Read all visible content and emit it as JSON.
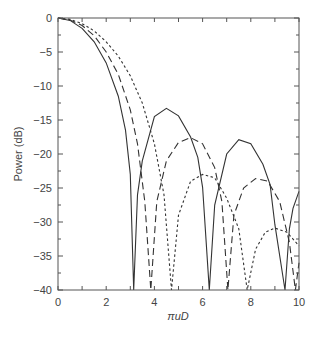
{
  "chart_data": {
    "type": "line",
    "title": "",
    "xlabel": "πuD",
    "ylabel": "Power (dB)",
    "xlim": [
      0,
      10
    ],
    "ylim": [
      -40,
      0
    ],
    "x_ticks": [
      "0",
      "2",
      "4",
      "6",
      "8",
      "10"
    ],
    "y_ticks": [
      "0",
      "−5",
      "−10",
      "−15",
      "−20",
      "−25",
      "−30",
      "−35",
      "−40"
    ],
    "grid": false,
    "legend": null,
    "series": [
      {
        "name": "solid",
        "style": "solid",
        "points": [
          [
            0,
            0
          ],
          [
            0.5,
            -0.36
          ],
          [
            1,
            -1.51
          ],
          [
            1.5,
            -3.5
          ],
          [
            2,
            -6.6
          ],
          [
            2.5,
            -11.5
          ],
          [
            2.8,
            -16.5
          ],
          [
            3,
            -23
          ],
          [
            3.14,
            -40
          ],
          [
            3.3,
            -26
          ],
          [
            3.5,
            -21
          ],
          [
            4,
            -14.5
          ],
          [
            4.5,
            -13.3
          ],
          [
            5,
            -14.4
          ],
          [
            5.5,
            -17.5
          ],
          [
            5.8,
            -20.5
          ],
          [
            6,
            -24.9
          ],
          [
            6.28,
            -40
          ],
          [
            6.5,
            -27.5
          ],
          [
            7,
            -20
          ],
          [
            7.5,
            -17.9
          ],
          [
            8,
            -18.5
          ],
          [
            8.5,
            -21.5
          ],
          [
            8.8,
            -24.5
          ],
          [
            9,
            -30.4
          ],
          [
            9.42,
            -40
          ],
          [
            9.6,
            -31
          ],
          [
            9.75,
            -28
          ],
          [
            10,
            -25.5
          ]
        ]
      },
      {
        "name": "dashed",
        "style": "dashed",
        "points": [
          [
            0,
            0
          ],
          [
            0.5,
            -0.3
          ],
          [
            1,
            -1.1
          ],
          [
            1.5,
            -2.6
          ],
          [
            2,
            -5
          ],
          [
            2.5,
            -8.3
          ],
          [
            3,
            -13.5
          ],
          [
            3.3,
            -18.5
          ],
          [
            3.6,
            -27
          ],
          [
            3.85,
            -40
          ],
          [
            4.1,
            -27
          ],
          [
            4.5,
            -21
          ],
          [
            5,
            -18.3
          ],
          [
            5.5,
            -17.6
          ],
          [
            6,
            -18.5
          ],
          [
            6.5,
            -22
          ],
          [
            6.8,
            -27
          ],
          [
            7.05,
            -40
          ],
          [
            7.3,
            -29
          ],
          [
            7.7,
            -25
          ],
          [
            8.2,
            -23.6
          ],
          [
            8.7,
            -24
          ],
          [
            9.2,
            -27
          ],
          [
            9.6,
            -33
          ],
          [
            9.85,
            -40
          ],
          [
            10,
            -36
          ]
        ]
      },
      {
        "name": "dotted",
        "style": "dotted",
        "points": [
          [
            0,
            0
          ],
          [
            0.5,
            -0.2
          ],
          [
            1,
            -0.83
          ],
          [
            1.5,
            -1.9
          ],
          [
            2,
            -3.5
          ],
          [
            2.5,
            -5.6
          ],
          [
            3,
            -8.5
          ],
          [
            3.5,
            -12.5
          ],
          [
            4,
            -18.5
          ],
          [
            4.4,
            -26
          ],
          [
            4.71,
            -40
          ],
          [
            5,
            -29
          ],
          [
            5.5,
            -24
          ],
          [
            6,
            -23
          ],
          [
            6.5,
            -23.5
          ],
          [
            7,
            -26.5
          ],
          [
            7.5,
            -31
          ],
          [
            7.85,
            -40
          ],
          [
            8.2,
            -34
          ],
          [
            8.6,
            -31.5
          ],
          [
            9,
            -30.9
          ],
          [
            9.5,
            -31.5
          ],
          [
            10,
            -33.5
          ]
        ]
      }
    ]
  }
}
